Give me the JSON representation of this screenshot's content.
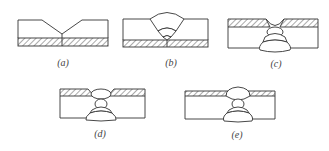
{
  "figure": {
    "panels": [
      {
        "id": "a",
        "label": "(a)",
        "description": "V-groove joint on hatched backing strip, no weld"
      },
      {
        "id": "b",
        "label": "(b)",
        "description": "Multi-pass weld beads filling groove from top, backing strip below"
      },
      {
        "id": "c",
        "label": "(c)",
        "description": "Hatched layer on top with root groove; weld passes built downward"
      },
      {
        "id": "d",
        "label": "(d)",
        "description": "Hatched top layer, V-groove with root bead and back passes"
      },
      {
        "id": "e",
        "label": "(e)",
        "description": "Thin hatched top layer, small cap bead and back passes"
      }
    ]
  },
  "colors": {
    "line": "#333333",
    "hatch": "#555555",
    "background": "#ffffff"
  }
}
